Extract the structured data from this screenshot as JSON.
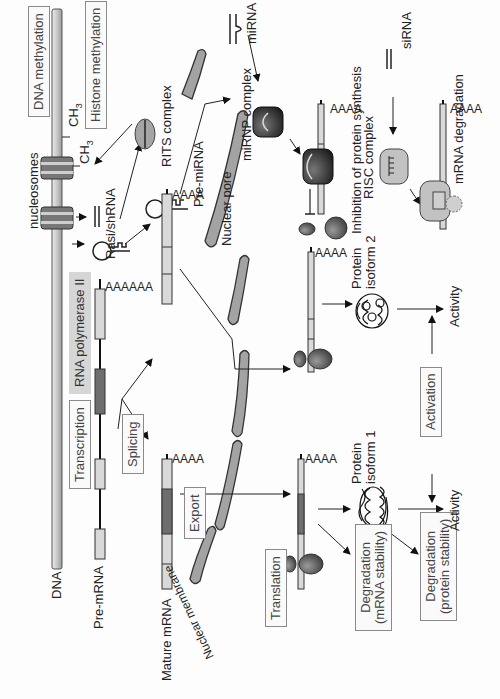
{
  "diagram": {
    "orientation": "rotated 90deg counter-clockwise",
    "colors": {
      "background": "#fdfdfd",
      "line": "#222222",
      "exon_light": "#d9d9d9",
      "exon_dark": "#6e6e6e",
      "membrane": "#8c8c8c",
      "ribosome": "#555555",
      "mirnp": "#2b2b2b",
      "risc": "#bdbdbd",
      "label_box_grey": "#d6d6d6"
    },
    "molecules": {
      "dna": "DNA",
      "pre_mrna": "Pre-mRNA",
      "mature_mrna": "Mature mRNA",
      "nucleosomes": "nucleosomes",
      "ch3_a": "CH",
      "ch3_b": "CH",
      "ch3_sub": "3",
      "rasi": "Rasi/shRNA",
      "rits": "RITS  complex",
      "pre_mirna": "Pre-miRNA",
      "mirna": "miRNA",
      "sirna": "siRNA",
      "mirnp": "miRNP complex",
      "risc": "RISC complex",
      "polya_long": "AAAAAA",
      "polya": "AAAA",
      "nuclear_pore": "Nuclear pore",
      "nuclear_membrane": "Nuclear membrane",
      "protein1_line1": "Protein",
      "protein1_line2": "isoform 1",
      "protein2_line1": "Protein",
      "protein2_line2": "isoform 2",
      "activity1": "Activity",
      "activity2": "Activity",
      "inhibition": "Inhibition of protein synthesis",
      "mrna_degradation": "mRNA degradation"
    },
    "process_boxes": {
      "dna_methylation": "DNA methylation",
      "histone_methylation": "Histone methylation",
      "rna_pol": "RNA polymerase II",
      "transcription": "Transcription",
      "splicing": "Splicing",
      "export": "Export",
      "translation": "Translation",
      "activation": "Activation",
      "deg_mrna_1": "Degradation",
      "deg_mrna_2": "(mRNA stability)",
      "deg_protein_1": "Degradation",
      "deg_protein_2": "(protein stability)"
    }
  }
}
